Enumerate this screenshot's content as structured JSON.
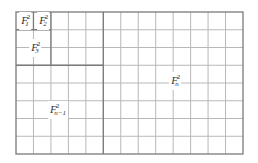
{
  "diagram": {
    "grid": {
      "columns": 13,
      "rows": 8,
      "line_color": "#b8b8b8",
      "border_color": "#7a7a7a"
    },
    "regions": [
      {
        "id": "f1",
        "base": "F",
        "sub": "1",
        "sup": "2"
      },
      {
        "id": "f2",
        "base": "F",
        "sub": "2",
        "sup": "2"
      },
      {
        "id": "f3",
        "base": "F",
        "sub": "3",
        "sup": "2"
      },
      {
        "id": "fn1",
        "base": "F",
        "sub": "n−1",
        "sup": "2"
      },
      {
        "id": "fn",
        "base": "F",
        "sub": "n",
        "sup": "2"
      }
    ]
  }
}
